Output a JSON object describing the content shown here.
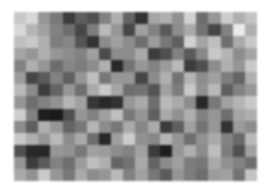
{
  "image": {
    "description": "Grayscale random block-noise image",
    "cols": 20,
    "rows": 14,
    "gray_values": [
      [
        200,
        215,
        150,
        120,
        60,
        95,
        80,
        130,
        175,
        100,
        50,
        165,
        175,
        145,
        210,
        110,
        150,
        205,
        175,
        195
      ],
      [
        215,
        180,
        160,
        130,
        110,
        70,
        125,
        185,
        150,
        70,
        160,
        130,
        90,
        140,
        170,
        115,
        70,
        130,
        235,
        175
      ],
      [
        190,
        200,
        175,
        125,
        135,
        85,
        50,
        140,
        160,
        140,
        110,
        155,
        120,
        95,
        210,
        165,
        190,
        110,
        170,
        200
      ],
      [
        165,
        150,
        175,
        150,
        140,
        130,
        160,
        75,
        140,
        140,
        170,
        60,
        80,
        130,
        90,
        135,
        200,
        180,
        140,
        165
      ],
      [
        130,
        175,
        150,
        110,
        135,
        125,
        140,
        175,
        40,
        115,
        150,
        130,
        155,
        185,
        60,
        80,
        140,
        175,
        150,
        200
      ],
      [
        155,
        70,
        90,
        130,
        95,
        150,
        190,
        120,
        150,
        150,
        70,
        140,
        175,
        115,
        180,
        140,
        160,
        125,
        100,
        175
      ],
      [
        185,
        140,
        60,
        100,
        150,
        110,
        170,
        200,
        165,
        110,
        115,
        85,
        160,
        125,
        200,
        145,
        185,
        95,
        130,
        150
      ],
      [
        150,
        110,
        130,
        145,
        180,
        160,
        55,
        40,
        50,
        150,
        170,
        110,
        185,
        170,
        140,
        40,
        120,
        160,
        180,
        200
      ],
      [
        205,
        130,
        30,
        25,
        80,
        150,
        130,
        160,
        190,
        120,
        150,
        95,
        170,
        145,
        175,
        130,
        150,
        110,
        165,
        175
      ],
      [
        140,
        95,
        175,
        150,
        100,
        120,
        180,
        140,
        120,
        170,
        135,
        170,
        60,
        95,
        160,
        115,
        150,
        50,
        155,
        140
      ],
      [
        200,
        175,
        150,
        185,
        140,
        170,
        110,
        40,
        160,
        205,
        145,
        135,
        180,
        150,
        110,
        145,
        170,
        130,
        105,
        185
      ],
      [
        80,
        40,
        40,
        150,
        145,
        120,
        160,
        155,
        140,
        130,
        160,
        60,
        30,
        150,
        175,
        140,
        190,
        125,
        80,
        160
      ],
      [
        150,
        60,
        90,
        130,
        110,
        155,
        190,
        175,
        100,
        115,
        170,
        100,
        140,
        160,
        125,
        120,
        170,
        145,
        130,
        110
      ],
      [
        170,
        145,
        200,
        150,
        120,
        170,
        140,
        150,
        185,
        130,
        160,
        120,
        90,
        150,
        125,
        110,
        155,
        160,
        115,
        195
      ]
    ]
  }
}
